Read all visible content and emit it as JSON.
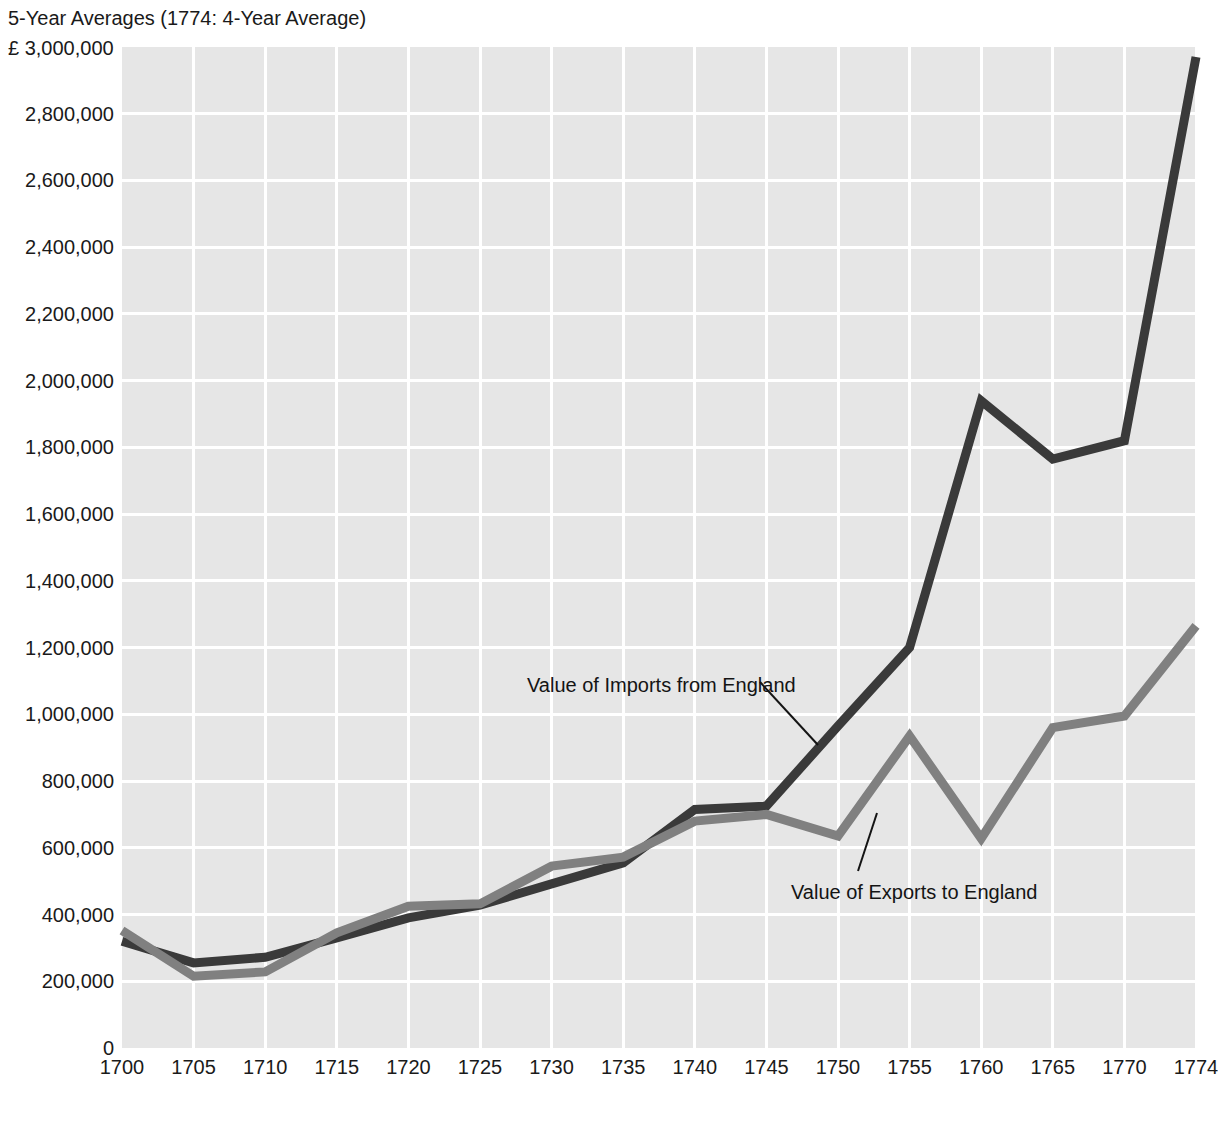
{
  "chart_data": {
    "type": "line",
    "title": "5-Year Averages (1774: 4-Year Average)",
    "xlabel": "",
    "ylabel": "",
    "y_unit_label": "£ 3,000,000",
    "currency_symbol": "£",
    "categories": [
      "1700",
      "1705",
      "1710",
      "1715",
      "1720",
      "1725",
      "1730",
      "1735",
      "1740",
      "1745",
      "1750",
      "1755",
      "1760",
      "1765",
      "1770",
      "1774"
    ],
    "x": [
      1700,
      1705,
      1710,
      1715,
      1720,
      1725,
      1730,
      1735,
      1740,
      1745,
      1750,
      1755,
      1760,
      1765,
      1770,
      1774
    ],
    "ylim": [
      0,
      3000000
    ],
    "y_ticks": [
      0,
      200000,
      400000,
      600000,
      800000,
      1000000,
      1200000,
      1400000,
      1600000,
      1800000,
      2000000,
      2200000,
      2400000,
      2600000,
      2800000,
      3000000
    ],
    "y_tick_labels": [
      "0",
      "200,000",
      "400,000",
      "600,000",
      "800,000",
      "1,000,000",
      "1,200,000",
      "1,400,000",
      "1,600,000",
      "1,800,000",
      "2,000,000",
      "2,200,000",
      "2,400,000",
      "2,600,000",
      "2,800,000",
      "3,000,000"
    ],
    "grid": true,
    "legend": "annotations",
    "plot_background": "#e6e6e6",
    "gridline_color": "#ffffff",
    "series": [
      {
        "name": "Value of Imports from England",
        "color": "#3a3a3a",
        "line_width": 9,
        "values": [
          320000,
          255000,
          272000,
          330000,
          390000,
          428000,
          492000,
          555000,
          715000,
          725000,
          965000,
          1200000,
          1940000,
          1765000,
          1820000,
          2970000
        ]
      },
      {
        "name": "Value of Exports to England",
        "color": "#808080",
        "line_width": 9,
        "values": [
          352000,
          215000,
          228000,
          345000,
          425000,
          432000,
          545000,
          572000,
          680000,
          700000,
          635000,
          935000,
          628000,
          960000,
          995000,
          1265000
        ]
      }
    ],
    "annotations": [
      {
        "text": "Value of Imports from England",
        "target_series": "Value of Imports from England",
        "leader_from": [
          760,
          682
        ],
        "leader_to": [
          818,
          745
        ]
      },
      {
        "text": "Value of Exports to England",
        "target_series": "Value of Exports to England",
        "leader_from": [
          858,
          871
        ],
        "leader_to": [
          877,
          813
        ]
      }
    ]
  }
}
